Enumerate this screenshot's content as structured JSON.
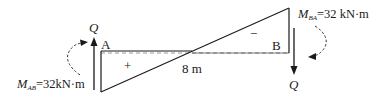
{
  "diagram": {
    "type": "shear-force-diagram",
    "span_label": "8 m",
    "left_node": {
      "label": "A",
      "force_label": "Q",
      "force_direction": "up",
      "moment": {
        "symbol": "M",
        "subscript": "AB",
        "value_text": "=32kN·m"
      }
    },
    "right_node": {
      "label": "B",
      "force_label": "Q",
      "force_direction": "down",
      "moment": {
        "symbol": "M",
        "subscript": "BA",
        "value_text": "=32 kN·m"
      }
    },
    "regions": [
      {
        "sign": "+",
        "position": "left-below-baseline"
      },
      {
        "sign": "−",
        "position": "right-above-baseline"
      }
    ],
    "colors": {
      "line": "#1a1a1a",
      "dashed": "#888888"
    }
  }
}
